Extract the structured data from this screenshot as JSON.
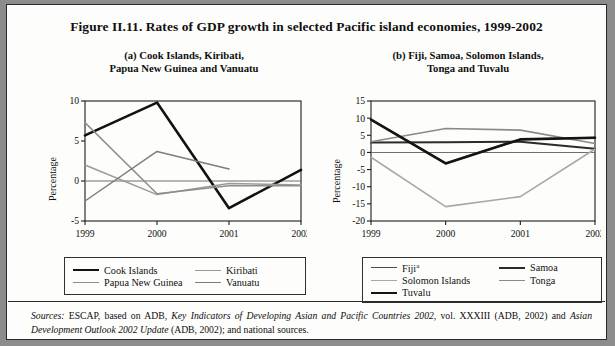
{
  "figure": {
    "title": "Figure II.11.  Rates of GDP growth in selected Pacific island economies, 1999-2002",
    "panel_a_title_line1": "(a)  Cook Islands, Kiribati,",
    "panel_a_title_line2": "Papua New Guinea and Vanuatu",
    "panel_b_title_line1": "(b)  Fiji, Samoa, Solomon Islands,",
    "panel_b_title_line2": "Tonga and Tuvalu"
  },
  "source": {
    "label": "Sources:",
    "text_1": "  ESCAP, based on ADB, ",
    "italic_1": "Key Indicators of Developing Asian and Pacific Countries 2002",
    "text_2": ", vol. XXXIII (ADB, 2002) and ",
    "italic_2": "Asian Development Outlook 2002 Update",
    "text_3": " (ADB, 2002); and national sources."
  },
  "legend_a": [
    {
      "label": "Cook Islands",
      "color": "#121212",
      "width": 2.6
    },
    {
      "label": "Kiribati",
      "color": "#9a9a9a",
      "width": 1.5
    },
    {
      "label": "Papua New Guinea",
      "color": "#8e8e8e",
      "width": 1.5
    },
    {
      "label": "Vanuatu",
      "color": "#7d7d7d",
      "width": 1.5
    }
  ],
  "legend_b": [
    {
      "label": "Fiji",
      "sup": "a",
      "color": "#4a4a4a",
      "width": 1.8
    },
    {
      "label": "Samoa",
      "color": "#2b2b2b",
      "width": 2.0
    },
    {
      "label": "Solomon Islands",
      "color": "#a8a8a8",
      "width": 1.6
    },
    {
      "label": "Tonga",
      "color": "#8a8a8a",
      "width": 1.6
    },
    {
      "label": "Tuvalu",
      "color": "#141414",
      "width": 2.6
    }
  ],
  "chart_data": [
    {
      "type": "line",
      "title": "(a)  Cook Islands, Kiribati, Papua New Guinea and Vanuatu",
      "xlabel": "",
      "ylabel": "Percentage",
      "x": [
        1999,
        2000,
        2001,
        2002
      ],
      "xticks": [
        "1999",
        "2000",
        "2001",
        "2002"
      ],
      "yticks": [
        10,
        5,
        0,
        -5
      ],
      "ylim": [
        -5,
        10
      ],
      "grid": false,
      "legend_position": "below",
      "series": [
        {
          "name": "Cook Islands",
          "color": "#121212",
          "width": 2.6,
          "values": [
            5.7,
            9.8,
            -3.4,
            1.4
          ]
        },
        {
          "name": "Kiribati",
          "color": "#9a9a9a",
          "width": 1.5,
          "values": [
            2.0,
            -1.7,
            -0.3,
            -0.5
          ]
        },
        {
          "name": "Papua New Guinea",
          "color": "#8e8e8e",
          "width": 1.5,
          "values": [
            7.3,
            -1.6,
            -0.6,
            -0.6
          ]
        },
        {
          "name": "Vanuatu",
          "color": "#7d7d7d",
          "width": 1.5,
          "values": [
            -2.5,
            3.7,
            1.5,
            null
          ]
        }
      ]
    },
    {
      "type": "line",
      "title": "(b)  Fiji, Samoa, Solomon Islands, Tonga and Tuvalu",
      "xlabel": "",
      "ylabel": "Percentage",
      "x": [
        1999,
        2000,
        2001,
        2002
      ],
      "xticks": [
        "1999",
        "2000",
        "2001",
        "2002"
      ],
      "yticks": [
        15,
        10,
        5,
        0,
        -5,
        -10,
        -15,
        -20
      ],
      "ylim": [
        -20,
        15
      ],
      "grid": false,
      "legend_position": "below",
      "series": [
        {
          "name": "Fiji",
          "color": "#4a4a4a",
          "width": 1.8,
          "values": [
            9.6,
            -3.2,
            3.8,
            4.3
          ]
        },
        {
          "name": "Samoa",
          "color": "#2b2b2b",
          "width": 2.0,
          "values": [
            2.9,
            3.0,
            3.1,
            1.1
          ]
        },
        {
          "name": "Solomon Islands",
          "color": "#a8a8a8",
          "width": 1.6,
          "values": [
            -1.4,
            -15.8,
            -12.9,
            1.0
          ]
        },
        {
          "name": "Tonga",
          "color": "#8a8a8a",
          "width": 1.6,
          "values": [
            3.1,
            7.0,
            6.5,
            2.6
          ]
        },
        {
          "name": "Tuvalu",
          "color": "#141414",
          "width": 2.6,
          "values": [
            9.6,
            -3.2,
            3.8,
            4.3
          ]
        }
      ]
    }
  ]
}
